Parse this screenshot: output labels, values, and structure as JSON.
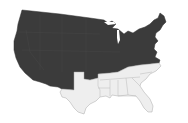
{
  "map": {
    "subject": "Contiguous United States",
    "colors": {
      "background": "#ffffff",
      "dark_fill": "#3b3b3b",
      "dark_stroke": "#333333",
      "light_fill": "#eeeeee",
      "light_stroke": "#a8a8a8"
    },
    "groups": [
      {
        "name": "dark-states",
        "fill_key": "dark",
        "states": [
          "Washington",
          "Oregon",
          "California",
          "Nevada",
          "Idaho",
          "Montana",
          "Wyoming",
          "Utah",
          "Arizona",
          "Colorado",
          "New Mexico",
          "North Dakota",
          "South Dakota",
          "Nebraska",
          "Kansas",
          "Oklahoma",
          "Minnesota",
          "Iowa",
          "Missouri",
          "Wisconsin",
          "Illinois",
          "Michigan",
          "Indiana",
          "Ohio",
          "Kentucky",
          "West Virginia",
          "Virginia",
          "Pennsylvania",
          "New York",
          "Maryland",
          "Delaware",
          "New Jersey",
          "Connecticut",
          "Rhode Island",
          "Massachusetts",
          "Vermont",
          "New Hampshire",
          "Maine"
        ]
      },
      {
        "name": "light-states",
        "fill_key": "light",
        "states": [
          "Texas",
          "Arkansas",
          "Louisiana",
          "Mississippi",
          "Alabama",
          "Tennessee",
          "Georgia",
          "Florida",
          "South Carolina",
          "North Carolina"
        ]
      }
    ]
  }
}
